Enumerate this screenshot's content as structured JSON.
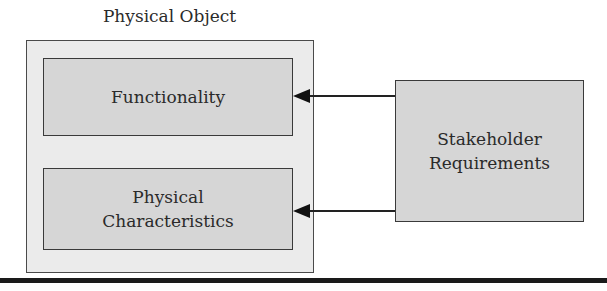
{
  "diagram": {
    "container": {
      "title": "Physical Object"
    },
    "inner_boxes": [
      {
        "label": "Functionality"
      },
      {
        "label_line1": "Physical",
        "label_line2": "Characteristics"
      }
    ],
    "source_box": {
      "label_line1": "Stakeholder",
      "label_line2": "Requirements"
    },
    "arrows": [
      {
        "from": "Stakeholder Requirements",
        "to": "Functionality"
      },
      {
        "from": "Stakeholder Requirements",
        "to": "Physical Characteristics"
      }
    ],
    "colors": {
      "outer_fill": "#ebebeb",
      "box_fill": "#d6d6d6",
      "stroke": "#3a3a3a"
    }
  }
}
